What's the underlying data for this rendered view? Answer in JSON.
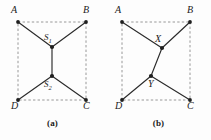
{
  "document": {
    "type": "geometry-figure",
    "background_color": "#fdfdfd",
    "ink_color": "#222222",
    "dashed_color": "#8c8c8c",
    "solid_color": "#2b2b2b"
  },
  "figures": [
    {
      "id": "a",
      "caption": "(a)",
      "square_vertices": [
        {
          "name": "A",
          "label": "A",
          "x": 18,
          "y": 22
        },
        {
          "name": "B",
          "label": "B",
          "x": 86,
          "y": 22
        },
        {
          "name": "C",
          "label": "C",
          "x": 86,
          "y": 100
        },
        {
          "name": "D",
          "label": "D",
          "x": 18,
          "y": 100
        }
      ],
      "inner_points": [
        {
          "name": "S1",
          "label": "S",
          "subscript": "1",
          "x": 52,
          "y": 47
        },
        {
          "name": "S2",
          "label": "S",
          "subscript": "2",
          "x": 52,
          "y": 76
        }
      ],
      "solid_edges": [
        {
          "from": "A",
          "to": "S1"
        },
        {
          "from": "B",
          "to": "S1"
        },
        {
          "from": "S1",
          "to": "S2"
        },
        {
          "from": "D",
          "to": "S2"
        },
        {
          "from": "C",
          "to": "S2"
        }
      ],
      "dashed_edges": [
        {
          "from": "A",
          "to": "B"
        },
        {
          "from": "B",
          "to": "C"
        },
        {
          "from": "C",
          "to": "D"
        },
        {
          "from": "D",
          "to": "A"
        }
      ]
    },
    {
      "id": "b",
      "caption": "(b)",
      "square_vertices": [
        {
          "name": "A",
          "label": "A",
          "x": 16,
          "y": 22
        },
        {
          "name": "B",
          "label": "B",
          "x": 84,
          "y": 22
        },
        {
          "name": "C",
          "label": "C",
          "x": 84,
          "y": 100
        },
        {
          "name": "D",
          "label": "D",
          "x": 16,
          "y": 100
        }
      ],
      "inner_points": [
        {
          "name": "X",
          "label": "X",
          "x": 56,
          "y": 48
        },
        {
          "name": "Y",
          "label": "Y",
          "x": 45,
          "y": 76
        }
      ],
      "solid_edges": [
        {
          "from": "A",
          "to": "X"
        },
        {
          "from": "B",
          "to": "X"
        },
        {
          "from": "X",
          "to": "Y"
        },
        {
          "from": "D",
          "to": "Y"
        },
        {
          "from": "C",
          "to": "Y"
        }
      ],
      "dashed_edges": [
        {
          "from": "A",
          "to": "B"
        },
        {
          "from": "B",
          "to": "C"
        },
        {
          "from": "C",
          "to": "D"
        },
        {
          "from": "D",
          "to": "A"
        }
      ]
    }
  ],
  "labels": {
    "a": {
      "A": "A",
      "B": "B",
      "C": "C",
      "D": "D",
      "S1_base": "S",
      "S1_sub": "1",
      "S2_base": "S",
      "S2_sub": "2"
    },
    "b": {
      "A": "A",
      "B": "B",
      "C": "C",
      "D": "D",
      "X": "X",
      "Y": "Y"
    },
    "captions": {
      "a": "(a)",
      "b": "(b)"
    }
  }
}
